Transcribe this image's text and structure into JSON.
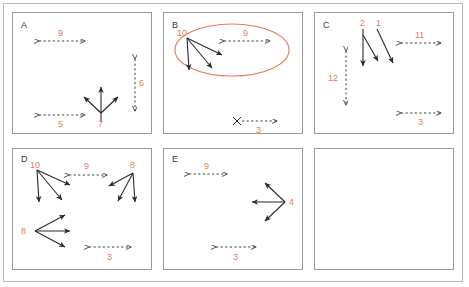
{
  "figure": {
    "title": "",
    "accent_color": "#e8795b",
    "stroke_color": "#2b2b2b",
    "frame_color": "#9a9a9a",
    "panel_count": 6,
    "highlight": {
      "shape": "ellipse",
      "panel": "B",
      "color": "#e8795b",
      "encloses": [
        "10",
        "9"
      ]
    }
  },
  "panels": [
    {
      "id": "A",
      "label": "A",
      "items": [
        {
          "kind": "dashed-double-arrow",
          "orientation": "horizontal",
          "label": "9"
        },
        {
          "kind": "dashed-double-arrow",
          "orientation": "vertical",
          "label": "6"
        },
        {
          "kind": "dashed-double-arrow",
          "orientation": "horizontal",
          "label": "5"
        },
        {
          "kind": "arrow-cluster",
          "label": "7",
          "directions": [
            "up-left",
            "up",
            "up-right"
          ]
        }
      ]
    },
    {
      "id": "B",
      "label": "B",
      "items": [
        {
          "kind": "arrow-cluster",
          "label": "10",
          "directions": [
            "right",
            "down",
            "down-right"
          ]
        },
        {
          "kind": "dashed-double-arrow",
          "orientation": "horizontal",
          "label": "9"
        },
        {
          "kind": "dashed-arrow-with-x",
          "orientation": "horizontal",
          "label": "3"
        }
      ]
    },
    {
      "id": "C",
      "label": "C",
      "items": [
        {
          "kind": "arrow-cluster",
          "label": "2",
          "directions": [
            "down",
            "down-right"
          ]
        },
        {
          "kind": "arrow-cluster",
          "label": "1",
          "directions": [
            "down-right"
          ]
        },
        {
          "kind": "dashed-double-arrow",
          "orientation": "horizontal",
          "label": "11"
        },
        {
          "kind": "dashed-double-arrow",
          "orientation": "vertical",
          "label": "12"
        },
        {
          "kind": "dashed-double-arrow",
          "orientation": "horizontal",
          "label": "3"
        }
      ]
    },
    {
      "id": "D",
      "label": "D",
      "items": [
        {
          "kind": "arrow-cluster",
          "label": "10",
          "directions": [
            "right",
            "down",
            "down-right"
          ]
        },
        {
          "kind": "dashed-double-arrow",
          "orientation": "horizontal",
          "label": "9"
        },
        {
          "kind": "arrow-cluster",
          "label": "8",
          "directions": [
            "left",
            "down-left",
            "down"
          ]
        },
        {
          "kind": "arrow-cluster",
          "label": "8",
          "directions": [
            "up-right",
            "right",
            "down-right"
          ]
        },
        {
          "kind": "dashed-double-arrow",
          "orientation": "horizontal",
          "label": "3"
        }
      ]
    },
    {
      "id": "E",
      "label": "E",
      "items": [
        {
          "kind": "dashed-double-arrow",
          "orientation": "horizontal",
          "label": "9"
        },
        {
          "kind": "arrow-cluster",
          "label": "4",
          "directions": [
            "up-left",
            "left",
            "down-left"
          ]
        },
        {
          "kind": "dashed-double-arrow",
          "orientation": "horizontal",
          "label": "3"
        }
      ]
    },
    {
      "id": "F",
      "label": "",
      "items": []
    }
  ],
  "labels": {
    "a": "A",
    "b": "B",
    "c": "C",
    "d": "D",
    "e": "E",
    "a_9": "9",
    "a_6": "6",
    "a_5": "5",
    "a_7": "7",
    "b_10": "10",
    "b_9": "9",
    "b_3": "3",
    "c_2": "2",
    "c_1": "1",
    "c_11": "11",
    "c_12": "12",
    "c_3": "3",
    "d_10": "10",
    "d_9": "9",
    "d_8top": "8",
    "d_8left": "8",
    "d_3": "3",
    "e_9": "9",
    "e_4": "4",
    "e_3": "3"
  }
}
